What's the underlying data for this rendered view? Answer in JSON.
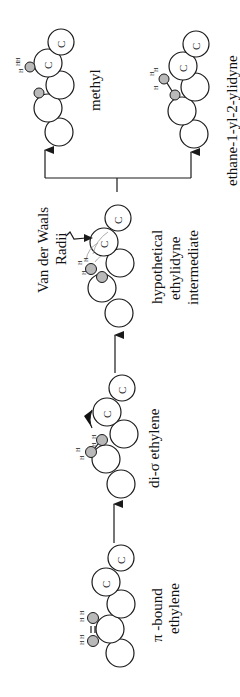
{
  "figure": {
    "orientation": "rotated 90° counter-clockwise",
    "flow": [
      "π -bound ethylene",
      "di-σ ethylene",
      "hypothetical ethylidyne intermediate",
      [
        "methyl",
        "ethane-1-yl-2-ylidyne"
      ]
    ]
  },
  "stages": {
    "pi_bound": {
      "line1": "π -bound",
      "line2": "ethylene",
      "atoms": {
        "c7": "C",
        "c7_sub": "7",
        "c11": "C",
        "c11_sub": "11"
      },
      "h": "H",
      "bond": "="
    },
    "di_sigma": {
      "label": "di-σ ethylene",
      "atoms": {
        "c7": "C",
        "c7_sub": "7",
        "c11": "C",
        "c11_sub": "11"
      },
      "h": "H"
    },
    "ethylidyne": {
      "line1": "hypothetical",
      "line2": "ethylidyne",
      "line3": "intermediate",
      "atoms": {
        "c7": "C",
        "c7_sub": "7",
        "c11": "C",
        "c11_sub": "11"
      },
      "h": "H"
    },
    "methyl": {
      "label": "methyl",
      "atoms": {
        "c7": "C",
        "c7_sub": "7",
        "c11": "C",
        "c11_sub": "11"
      },
      "h": "H"
    },
    "ethane_ylidyne": {
      "label": "ethane-1-yl-2-ylidyne",
      "atoms": {
        "c7": "C",
        "c7_sub": "7",
        "c11": "C",
        "c11_sub": "11"
      },
      "h": "H"
    }
  },
  "annotation": {
    "line1": "Van der Waals",
    "line2": "Radii"
  },
  "colors": {
    "stroke": "#1a1a1a",
    "small_atom_fill": "#b9b9b9",
    "background": "#ffffff"
  }
}
